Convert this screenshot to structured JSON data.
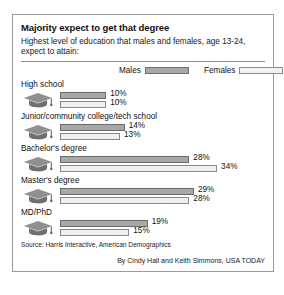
{
  "title": "Majority expect to get that degree",
  "subtitle": "Highest level of education that males and females, age 13-24, expect to attain:",
  "legend": {
    "males_label": "Males",
    "females_label": "Females",
    "males_color": "#a8a8a8",
    "females_color": "#f0f0f0"
  },
  "icon_name": "graduation-cap-icon",
  "source": "Source: Harris Interactive, American Demographics",
  "credit": "By Cindy Hall and Keith Simmons, USA TODAY",
  "groups": [
    {
      "label": "High school",
      "males": "10%",
      "females": "10%",
      "males_value": 10,
      "females_value": 10
    },
    {
      "label": "Junior/community college/tech school",
      "males": "14%",
      "females": "13%",
      "males_value": 14,
      "females_value": 13
    },
    {
      "label": "Bachelor's degree",
      "males": "28%",
      "females": "34%",
      "males_value": 28,
      "females_value": 34
    },
    {
      "label": "Master's degree",
      "males": "29%",
      "females": "28%",
      "males_value": 29,
      "females_value": 28
    },
    {
      "label": "MD/PhD",
      "males": "19%",
      "females": "15%",
      "males_value": 19,
      "females_value": 15
    }
  ],
  "chart_data": {
    "type": "bar",
    "title": "Majority expect to get that degree",
    "subtitle": "Highest level of education that males and females, age 13-24, expect to attain:",
    "orientation": "horizontal",
    "categories": [
      "High school",
      "Junior/community college/tech school",
      "Bachelor's degree",
      "Master's degree",
      "MD/PhD"
    ],
    "series": [
      {
        "name": "Males",
        "values": [
          10,
          14,
          28,
          29,
          19
        ],
        "color": "#a8a8a8"
      },
      {
        "name": "Females",
        "values": [
          10,
          13,
          34,
          28,
          15
        ],
        "color": "#f0f0f0"
      }
    ],
    "value_labels": [
      [
        "10%",
        "10%"
      ],
      [
        "14%",
        "13%"
      ],
      [
        "28%",
        "34%"
      ],
      [
        "29%",
        "28%"
      ],
      [
        "19%",
        "15%"
      ]
    ],
    "xlabel": "",
    "ylabel": "",
    "xlim": [
      0,
      34
    ],
    "unit": "percent",
    "grid": false,
    "legend_position": "top",
    "source": "Source: Harris Interactive, American Demographics",
    "credit": "By Cindy Hall and Keith Simmons, USA TODAY"
  }
}
